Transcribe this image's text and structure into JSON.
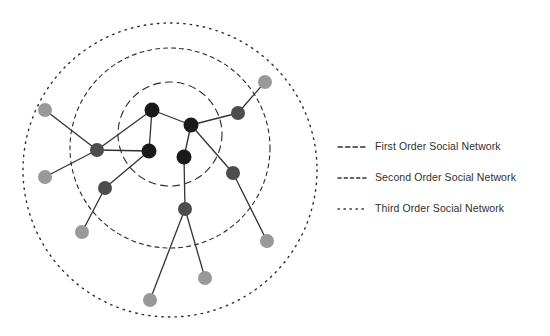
{
  "figure": {
    "type": "node-link-diagram"
  },
  "colors": {
    "core_node": "#1a1a1a",
    "middle_node": "#4d4d4d",
    "outer_node": "#999999",
    "edge": "#333333",
    "circle_stroke": "#2b2b2b",
    "legend_text": "#303030",
    "background": "#ffffff"
  },
  "chart_data": {
    "type": "scatter",
    "title": "",
    "xlabel": "",
    "ylabel": "",
    "grid": false,
    "legend_position": "right",
    "rings": [
      {
        "id": "ring-first",
        "order": 1,
        "label": "First Order Social Network",
        "cx": 170,
        "cy": 134,
        "r": 52,
        "dash": "7 5",
        "stroke_width": 1.1
      },
      {
        "id": "ring-second",
        "order": 2,
        "label": "Second Order Social Network",
        "cx": 170,
        "cy": 148,
        "r": 100,
        "dash": "4 4",
        "stroke_width": 1.1
      },
      {
        "id": "ring-third",
        "order": 3,
        "label": "Third Order Social Network",
        "cx": 170,
        "cy": 170,
        "r": 147,
        "dash": "1.4 5.2",
        "stroke_width": 1.4
      }
    ],
    "nodes": [
      {
        "id": "c1",
        "ring": "first",
        "shade": "core",
        "x": 152,
        "y": 110,
        "r": 7.5
      },
      {
        "id": "c2",
        "ring": "first",
        "shade": "core",
        "x": 191,
        "y": 125,
        "r": 7.5
      },
      {
        "id": "c3",
        "ring": "first",
        "shade": "core",
        "x": 149,
        "y": 151,
        "r": 7.5
      },
      {
        "id": "c4",
        "ring": "first",
        "shade": "core",
        "x": 184,
        "y": 157,
        "r": 7.5
      },
      {
        "id": "m1",
        "ring": "second",
        "shade": "middle",
        "x": 97,
        "y": 150,
        "r": 7.0
      },
      {
        "id": "m2",
        "ring": "second",
        "shade": "middle",
        "x": 105,
        "y": 188,
        "r": 7.0
      },
      {
        "id": "m3",
        "ring": "second",
        "shade": "middle",
        "x": 238,
        "y": 113,
        "r": 7.0
      },
      {
        "id": "m4",
        "ring": "second",
        "shade": "middle",
        "x": 233,
        "y": 173,
        "r": 7.0
      },
      {
        "id": "m5",
        "ring": "second",
        "shade": "middle",
        "x": 185,
        "y": 209,
        "r": 7.0
      },
      {
        "id": "o1",
        "ring": "third",
        "shade": "outer",
        "x": 45,
        "y": 110,
        "r": 7.0
      },
      {
        "id": "o2",
        "ring": "third",
        "shade": "outer",
        "x": 45,
        "y": 177,
        "r": 7.0
      },
      {
        "id": "o3",
        "ring": "third",
        "shade": "outer",
        "x": 82,
        "y": 232,
        "r": 7.0
      },
      {
        "id": "o4",
        "ring": "third",
        "shade": "outer",
        "x": 265,
        "y": 82,
        "r": 7.0
      },
      {
        "id": "o5",
        "ring": "third",
        "shade": "outer",
        "x": 267,
        "y": 241,
        "r": 7.0
      },
      {
        "id": "o6",
        "ring": "third",
        "shade": "outer",
        "x": 205,
        "y": 278,
        "r": 7.0
      },
      {
        "id": "o7",
        "ring": "third",
        "shade": "outer",
        "x": 150,
        "y": 300,
        "r": 7.0
      }
    ],
    "edges": [
      {
        "source": "c1",
        "target": "c2"
      },
      {
        "source": "c1",
        "target": "c3"
      },
      {
        "source": "c2",
        "target": "c4"
      },
      {
        "source": "c1",
        "target": "m1"
      },
      {
        "source": "c2",
        "target": "m3"
      },
      {
        "source": "c2",
        "target": "m4"
      },
      {
        "source": "c3",
        "target": "m2"
      },
      {
        "source": "c4",
        "target": "m5"
      },
      {
        "source": "m1",
        "target": "o1"
      },
      {
        "source": "m1",
        "target": "o2"
      },
      {
        "source": "m2",
        "target": "o3"
      },
      {
        "source": "m3",
        "target": "o4"
      },
      {
        "source": "m4",
        "target": "o5"
      },
      {
        "source": "m5",
        "target": "o6"
      },
      {
        "source": "m5",
        "target": "o7"
      },
      {
        "source": "m1",
        "target": "c3"
      }
    ]
  },
  "legend": {
    "items": [
      {
        "id": "legend-first",
        "label": "First Order Social Network",
        "dash": "4.5 3"
      },
      {
        "id": "legend-second",
        "label": "Second Order Social Network",
        "dash": "3.2 3"
      },
      {
        "id": "legend-third",
        "label": "Third Order Social Network",
        "dash": "1.4 4.6"
      }
    ]
  }
}
